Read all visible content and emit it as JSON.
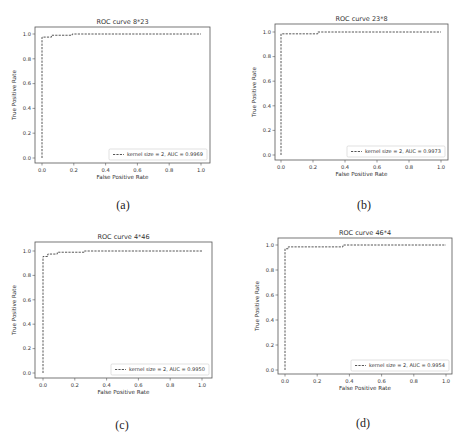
{
  "figure": {
    "panels": [
      {
        "id": "a",
        "caption": "(a)",
        "title": "ROC curve 8*23",
        "legend": "kernel size = 2, AUC = 0.9969"
      },
      {
        "id": "b",
        "caption": "(b)",
        "title": "ROC curve 23*8",
        "legend": "kernel size = 2, AUC = 0.9973"
      },
      {
        "id": "c",
        "caption": "(c)",
        "title": "ROC curve 4*46",
        "legend": "kernel size = 2, AUC = 0.9950"
      },
      {
        "id": "d",
        "caption": "(d)",
        "title": "ROC curve 46*4",
        "legend": "kernel size = 2, AUC = 0.9954"
      }
    ],
    "xlabel": "False Positive Rate",
    "ylabel": "True Positive Rate",
    "xticks": [
      "0.0",
      "0.2",
      "0.4",
      "0.6",
      "0.8",
      "1.0"
    ],
    "yticks": [
      "0.0",
      "0.2",
      "0.4",
      "0.6",
      "0.8",
      "1.0"
    ]
  },
  "chart_data": [
    {
      "type": "line",
      "title": "ROC curve 8*23",
      "xlabel": "False Positive Rate",
      "ylabel": "True Positive Rate",
      "xlim": [
        -0.05,
        1.05
      ],
      "ylim": [
        -0.05,
        1.05
      ],
      "grid": false,
      "legend_position": "lower right",
      "series": [
        {
          "name": "kernel size = 2, AUC = 0.9969",
          "style": "dashed",
          "x": [
            0.0,
            0.0,
            0.0,
            0.06,
            0.06,
            0.19,
            0.19,
            1.0
          ],
          "y": [
            0.0,
            0.0,
            0.975,
            0.975,
            0.99,
            0.99,
            1.0,
            1.0
          ]
        }
      ]
    },
    {
      "type": "line",
      "title": "ROC curve 23*8",
      "xlabel": "False Positive Rate",
      "ylabel": "True Positive Rate",
      "xlim": [
        -0.05,
        1.05
      ],
      "ylim": [
        -0.05,
        1.05
      ],
      "grid": false,
      "legend_position": "lower right",
      "series": [
        {
          "name": "kernel size = 2, AUC = 0.9973",
          "style": "dashed",
          "x": [
            0.0,
            0.0,
            0.23,
            0.23,
            1.0
          ],
          "y": [
            0.0,
            0.985,
            0.985,
            1.0,
            1.0
          ]
        }
      ]
    },
    {
      "type": "line",
      "title": "ROC curve 4*46",
      "xlabel": "False Positive Rate",
      "ylabel": "True Positive Rate",
      "xlim": [
        -0.05,
        1.05
      ],
      "ylim": [
        -0.05,
        1.05
      ],
      "grid": false,
      "legend_position": "lower right",
      "series": [
        {
          "name": "kernel size = 2, AUC = 0.9950",
          "style": "dashed",
          "x": [
            0.0,
            0.0,
            0.03,
            0.03,
            0.09,
            0.09,
            0.26,
            0.26,
            1.0
          ],
          "y": [
            0.0,
            0.955,
            0.955,
            0.975,
            0.975,
            0.99,
            0.99,
            1.0,
            1.0
          ]
        }
      ]
    },
    {
      "type": "line",
      "title": "ROC curve 46*4",
      "xlabel": "False Positive Rate",
      "ylabel": "True Positive Rate",
      "xlim": [
        -0.05,
        1.05
      ],
      "ylim": [
        -0.05,
        1.05
      ],
      "grid": false,
      "legend_position": "lower right",
      "series": [
        {
          "name": "kernel size = 2, AUC = 0.9954",
          "style": "dashed",
          "x": [
            0.0,
            0.0,
            0.02,
            0.02,
            0.36,
            0.36,
            1.0
          ],
          "y": [
            0.0,
            0.97,
            0.97,
            0.985,
            0.985,
            1.0,
            1.0
          ]
        }
      ]
    }
  ]
}
